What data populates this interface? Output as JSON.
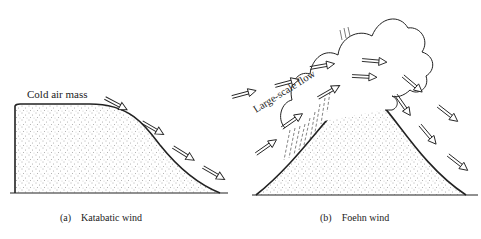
{
  "panel_a": {
    "label": "Cold air mass",
    "caption": "(a)    Katabatic wind"
  },
  "panel_b": {
    "flow_label": "Large-scale flow",
    "caption": "(b)    Foehn wind"
  },
  "colors": {
    "ink": "#222222",
    "background": "#ffffff"
  }
}
